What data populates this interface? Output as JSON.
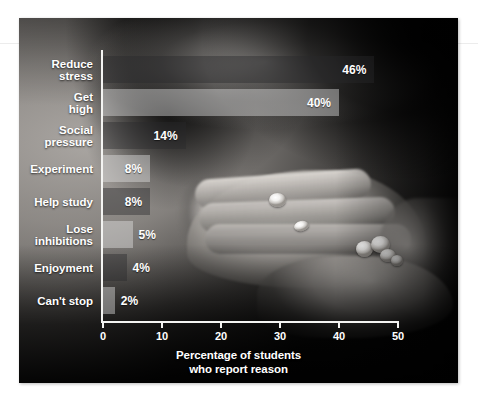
{
  "figure": {
    "media_type": "photograph-with-bar-chart-overlay",
    "photo_description": "grayscale photo of an open hand holding white pills"
  },
  "chart_data": {
    "type": "bar",
    "orientation": "horizontal",
    "title": "",
    "xlabel": "Percentage of students\nwho report reason",
    "ylabel": "",
    "xlim": [
      0,
      50
    ],
    "xticks": [
      0,
      10,
      20,
      30,
      40,
      50
    ],
    "xtick_labels": [
      "0",
      "10",
      "20",
      "30",
      "40",
      "50"
    ],
    "grid": false,
    "legend": null,
    "categories": [
      "Reduce\nstress",
      "Get\nhigh",
      "Social\npressure",
      "Experiment",
      "Help study",
      "Lose\ninhibitions",
      "Enjoyment",
      "Can't stop"
    ],
    "values": [
      46,
      40,
      14,
      8,
      8,
      5,
      4,
      2
    ],
    "value_labels": [
      "46%",
      "40%",
      "14%",
      "8%",
      "8%",
      "5%",
      "4%",
      "2%"
    ],
    "bar_shades": [
      "dark",
      "light",
      "dark",
      "light",
      "dark",
      "light",
      "dark",
      "light"
    ],
    "label_placement": [
      "inside",
      "inside",
      "inside",
      "inside",
      "inside",
      "outside",
      "outside",
      "outside"
    ],
    "colors": {
      "bar_light": "#e8e8e6",
      "bar_dark": "#28282a",
      "axis": "#f4f4f2",
      "text": "#ffffff",
      "plate_background": "#050505"
    }
  }
}
